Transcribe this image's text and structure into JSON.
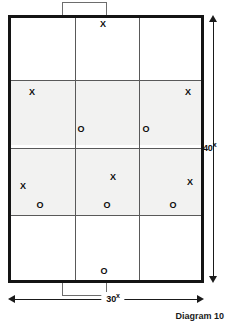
{
  "diagram": {
    "caption": "Diagram 10",
    "court": {
      "name": "court-outline",
      "columns": 3,
      "rows": 4
    },
    "notches": {
      "top_label": "top-goal-notch",
      "bottom_label": "bottom-goal-notch"
    },
    "dimensions": {
      "vertical": {
        "value": "40",
        "unit": "x",
        "label": "40x"
      },
      "horizontal": {
        "value": "30",
        "unit": "x",
        "label": "30x"
      }
    },
    "markers": [
      {
        "symbol": "X",
        "x": 103,
        "y": 24,
        "zone": "top-center"
      },
      {
        "symbol": "X",
        "x": 32,
        "y": 92,
        "zone": "upper-band-left"
      },
      {
        "symbol": "X",
        "x": 188,
        "y": 92,
        "zone": "upper-band-right"
      },
      {
        "symbol": "O",
        "x": 81,
        "y": 129,
        "zone": "upper-band-center"
      },
      {
        "symbol": "O",
        "x": 146,
        "y": 129,
        "zone": "upper-band-right"
      },
      {
        "symbol": "X",
        "x": 113,
        "y": 177,
        "zone": "lower-band-center"
      },
      {
        "symbol": "X",
        "x": 23,
        "y": 186,
        "zone": "lower-band-left"
      },
      {
        "symbol": "X",
        "x": 190,
        "y": 182,
        "zone": "lower-band-right"
      },
      {
        "symbol": "O",
        "x": 40,
        "y": 205,
        "zone": "lower-band-left"
      },
      {
        "symbol": "O",
        "x": 107,
        "y": 205,
        "zone": "lower-band-center"
      },
      {
        "symbol": "O",
        "x": 173,
        "y": 205,
        "zone": "lower-band-right"
      },
      {
        "symbol": "O",
        "x": 104,
        "y": 271,
        "zone": "bottom-center"
      }
    ],
    "gridlines": {
      "vertical_x": [
        64,
        128
      ],
      "horizontal_y": [
        62,
        130,
        197
      ]
    },
    "colors": {
      "ink": "#141414",
      "grid": "#595959",
      "shade": "#f2f2f1",
      "paper": "#ffffff"
    }
  }
}
